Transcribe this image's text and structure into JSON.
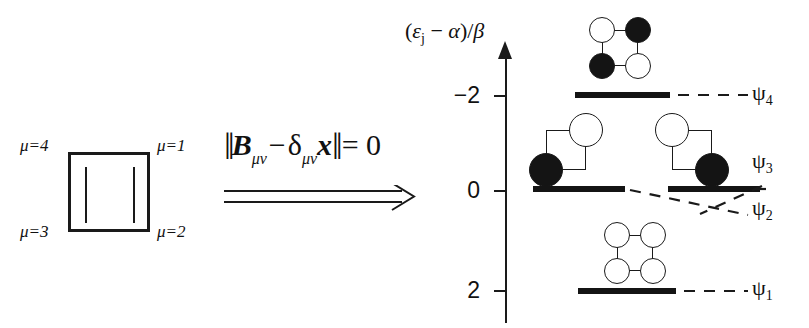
{
  "structure": {
    "name": "cyclobutadiene-square",
    "vertex_labels": [
      {
        "id": "mu4",
        "text": "μ=4",
        "position": "top-left"
      },
      {
        "id": "mu1",
        "text": "μ=1",
        "position": "top-right"
      },
      {
        "id": "mu3",
        "text": "μ=3",
        "position": "bottom-left"
      },
      {
        "id": "mu2",
        "text": "μ=2",
        "position": "bottom-right"
      }
    ]
  },
  "equation": {
    "full_text": "‖Bμν − δμν x‖ = 0",
    "norm_open": "‖",
    "matrix_symbol": "B",
    "matrix_sub": "μν",
    "minus": "−",
    "delta_symbol": "δ",
    "delta_sub": "μν",
    "variable": "x",
    "norm_close": "‖",
    "equals": "= 0",
    "arrow": "implies-double-arrow"
  },
  "axis": {
    "label_prefix": "(",
    "label_epsilon": "ε",
    "label_epsilon_sub": "j",
    "label_middle": " − ",
    "label_alpha": "α",
    "label_suffix": ")/",
    "label_beta": "β",
    "ticks": [
      {
        "text": "−2",
        "value": -2
      },
      {
        "text": "0",
        "value": 0
      },
      {
        "text": "2",
        "value": 2
      }
    ],
    "direction": "inverted"
  },
  "levels": [
    {
      "id": "psi4",
      "label": "ψ",
      "label_sub": "4",
      "energy": -2,
      "degeneracy": 1,
      "orbital_phases": [
        "open",
        "filled",
        "filled",
        "open"
      ],
      "description": "antibonding"
    },
    {
      "id": "psi3",
      "label": "ψ",
      "label_sub": "3",
      "energy": 0,
      "degeneracy": 2,
      "orbital_phases": [
        "open",
        "none",
        "none",
        "filled"
      ],
      "description": "nonbonding"
    },
    {
      "id": "psi2",
      "label": "ψ",
      "label_sub": "2",
      "energy": 0,
      "degeneracy": 2,
      "orbital_phases": [
        "none",
        "open",
        "filled",
        "none"
      ],
      "description": "nonbonding"
    },
    {
      "id": "psi1",
      "label": "ψ",
      "label_sub": "1",
      "energy": 2,
      "degeneracy": 1,
      "orbital_phases": [
        "open",
        "open",
        "open",
        "open"
      ],
      "description": "bonding"
    }
  ],
  "colors": {
    "ink": "#141414",
    "background": "#ffffff",
    "lobe_filled": "#141414",
    "lobe_open": "#ffffff"
  }
}
